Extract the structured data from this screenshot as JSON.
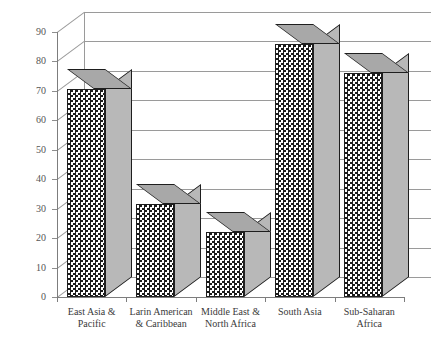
{
  "chart_data": {
    "type": "bar",
    "title": "",
    "subtitle": "",
    "xlabel": "",
    "ylabel": "Percentage of people who are poor",
    "categories": [
      "East Asia &\nPacific",
      "Larin American\n& Caribbean",
      "Middle East &\nNorth Africa",
      "South Asia",
      "Sub-Saharan\nAfrica"
    ],
    "category_lines": [
      [
        "East Asia &",
        "Pacific"
      ],
      [
        "Larin American",
        "& Caribbean"
      ],
      [
        "Middle East &",
        "North Africa"
      ],
      [
        "South Asia",
        ""
      ],
      [
        "Sub-Saharan",
        "Africa"
      ]
    ],
    "values": [
      70.5,
      31.5,
      22.0,
      86.0,
      76.0
    ],
    "ylim": [
      0,
      90
    ],
    "ytick_values": [
      0,
      10,
      20,
      30,
      40,
      50,
      60,
      70,
      80,
      90
    ],
    "ytick_labels": [
      "0",
      "10",
      "20",
      "30",
      "40",
      "50",
      "60",
      "70",
      "80",
      "90"
    ],
    "grid": true,
    "grid_axis": "y",
    "legend": null,
    "legend_position": "none",
    "style": "3d-column",
    "bar_fill": "black-white-checkerboard",
    "bar_side_color": "#b8b8b8",
    "bar_top_color": "#a8a8a8",
    "axis_color": "#7d7d7d",
    "grid_color": "#9a9a9a",
    "text_color": "#3a3a3a",
    "background": "#ffffff"
  }
}
